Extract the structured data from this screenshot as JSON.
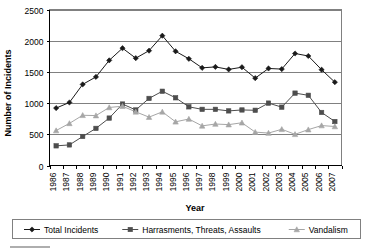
{
  "chart_data": {
    "type": "line",
    "title": "",
    "xlabel": "Year",
    "ylabel": "Number of Incidents",
    "ylim": [
      0,
      2500
    ],
    "ytick_step": 500,
    "yticks": [
      "0",
      "500",
      "1000",
      "1500",
      "2000",
      "2500"
    ],
    "grid": true,
    "legend_position": "bottom",
    "categories": [
      "1986",
      "1987",
      "1988",
      "1989",
      "1990",
      "1991",
      "1992",
      "1993",
      "1994",
      "1995",
      "1996",
      "1997",
      "1998",
      "1999",
      "2000",
      "2001",
      "2002",
      "2003",
      "2004",
      "2005",
      "2006",
      "2007"
    ],
    "series": [
      {
        "name": "Total Incidents",
        "marker": "diamond",
        "color": "#1a1a1a",
        "values": [
          920,
          1010,
          1300,
          1420,
          1685,
          1880,
          1720,
          1840,
          2080,
          1830,
          1710,
          1565,
          1580,
          1540,
          1575,
          1400,
          1555,
          1545,
          1795,
          1755,
          1535,
          1335
        ]
      },
      {
        "name": "Harrasments, Threats, Assaults",
        "marker": "square",
        "color": "#4d4d4d",
        "values": [
          315,
          330,
          465,
          595,
          760,
          985,
          890,
          1075,
          1190,
          1085,
          940,
          900,
          900,
          875,
          890,
          885,
          1000,
          935,
          1160,
          1125,
          850,
          705
        ]
      },
      {
        "name": "Vandalism",
        "marker": "triangle",
        "color": "#a6a6a6",
        "values": [
          560,
          675,
          805,
          800,
          930,
          950,
          860,
          775,
          860,
          700,
          745,
          635,
          665,
          655,
          685,
          535,
          520,
          580,
          500,
          575,
          640,
          625
        ]
      }
    ]
  },
  "legend": {
    "items": [
      {
        "label": "Total Incidents",
        "marker": "diamond-marker",
        "color": "#1a1a1a"
      },
      {
        "label": "Harrasments, Threats, Assaults",
        "marker": "square-marker",
        "color": "#4d4d4d"
      },
      {
        "label": "Vandalism",
        "marker": "triangle-marker",
        "color": "#a6a6a6"
      }
    ]
  },
  "colors": {
    "total_incidents": "#1a1a1a",
    "harrasments": "#4d4d4d",
    "vandalism": "#a6a6a6",
    "gridline": "#808080",
    "axis": "#000000",
    "background": "#ffffff"
  }
}
